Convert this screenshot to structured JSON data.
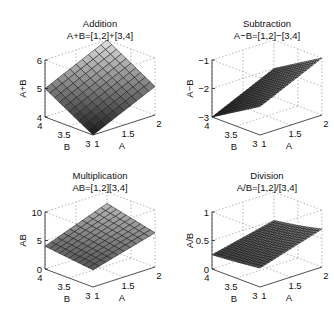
{
  "chart_data": [
    {
      "type": "surface3d",
      "title": "Addition",
      "subtitle": "A+B=[1,2]+[3,4]",
      "xlabel": "A",
      "ylabel": "B",
      "zlabel": "A+B",
      "xlim": [
        1,
        2
      ],
      "ylim": [
        3,
        4
      ],
      "zlim": [
        4,
        6
      ],
      "xticks": [
        1,
        1.5,
        2
      ],
      "yticks": [
        3,
        3.5,
        4
      ],
      "zticks": [
        4,
        5,
        6
      ],
      "xtick_labels": [
        "1",
        "1.5",
        "2"
      ],
      "ytick_labels": [
        "3",
        "3.5",
        "4"
      ],
      "ztick_labels": [
        "4",
        "5",
        "6"
      ],
      "operation": "add",
      "grid_n": 10,
      "corner_values": {
        "A1_B3": 4,
        "A2_B3": 5,
        "A1_B4": 5,
        "A2_B4": 6
      }
    },
    {
      "type": "surface3d",
      "title": "Subtraction",
      "subtitle": "A−B=[1,2]−[3,4]",
      "xlabel": "A",
      "ylabel": "B",
      "zlabel": "A−B",
      "xlim": [
        1,
        2
      ],
      "ylim": [
        3,
        4
      ],
      "zlim": [
        -3,
        -1
      ],
      "xticks": [
        1,
        1.5,
        2
      ],
      "yticks": [
        3,
        3.5,
        4
      ],
      "zticks": [
        -3,
        -2,
        -1
      ],
      "xtick_labels": [
        "1",
        "1.5",
        "2"
      ],
      "ytick_labels": [
        "3",
        "3.5",
        "4"
      ],
      "ztick_labels": [
        "−3",
        "−2",
        "−1"
      ],
      "operation": "subtract",
      "grid_n": 20,
      "corner_values": {
        "A1_B3": -2,
        "A2_B3": -1,
        "A1_B4": -3,
        "A2_B4": -2
      }
    },
    {
      "type": "surface3d",
      "title": "Multiplication",
      "subtitle": "AB=[1,2][3,4]",
      "xlabel": "A",
      "ylabel": "B",
      "zlabel": "AB",
      "xlim": [
        1,
        2
      ],
      "ylim": [
        3,
        4
      ],
      "zlim": [
        0,
        10
      ],
      "xticks": [
        1,
        1.5,
        2
      ],
      "yticks": [
        3,
        3.5,
        4
      ],
      "zticks": [
        0,
        5,
        10
      ],
      "xtick_labels": [
        "1",
        "1.5",
        "2"
      ],
      "ytick_labels": [
        "3",
        "3.5",
        "4"
      ],
      "ztick_labels": [
        "0",
        "5",
        "10"
      ],
      "operation": "multiply",
      "grid_n": 10,
      "corner_values": {
        "A1_B3": 3,
        "A2_B3": 6,
        "A1_B4": 4,
        "A2_B4": 8
      }
    },
    {
      "type": "surface3d",
      "title": "Division",
      "subtitle": "A/B=[1,2]/[3,4]",
      "xlabel": "A",
      "ylabel": "B",
      "zlabel": "A/B",
      "xlim": [
        1,
        2
      ],
      "ylim": [
        3,
        4
      ],
      "zlim": [
        0,
        1
      ],
      "xticks": [
        1,
        1.5,
        2
      ],
      "yticks": [
        3,
        3.5,
        4
      ],
      "zticks": [
        0,
        0.5,
        1
      ],
      "xtick_labels": [
        "1",
        "1.5",
        "2"
      ],
      "ytick_labels": [
        "3",
        "3.5",
        "4"
      ],
      "ztick_labels": [
        "0",
        "0.5",
        "1"
      ],
      "operation": "divide",
      "grid_n": 20,
      "corner_values": {
        "A1_B3": 0.333,
        "A2_B3": 0.667,
        "A1_B4": 0.25,
        "A2_B4": 0.5
      }
    }
  ]
}
